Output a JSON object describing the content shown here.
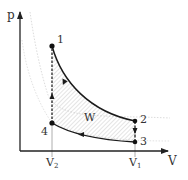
{
  "diagram": {
    "axes": {
      "y_label": "p",
      "x_label": "V"
    },
    "points": [
      {
        "id": "1",
        "label": "1",
        "x": 52,
        "y": 46
      },
      {
        "id": "2",
        "label": "2",
        "x": 135,
        "y": 121
      },
      {
        "id": "3",
        "label": "3",
        "x": 135,
        "y": 142
      },
      {
        "id": "4",
        "label": "4",
        "x": 52,
        "y": 123
      }
    ],
    "volume_ticks": [
      {
        "id": "V2",
        "base": "V",
        "sub": "2",
        "x": 52
      },
      {
        "id": "V1",
        "base": "V",
        "sub": "1",
        "x": 135
      }
    ],
    "work_label": "W",
    "processes": [
      {
        "from": "1",
        "to": "2",
        "type": "adiabatic expansion",
        "style": "solid"
      },
      {
        "from": "2",
        "to": "3",
        "type": "isochoric",
        "style": "solid-arrow-down"
      },
      {
        "from": "3",
        "to": "4",
        "type": "adiabatic compression",
        "style": "solid"
      },
      {
        "from": "4",
        "to": "1",
        "type": "isochoric",
        "style": "dashed"
      }
    ],
    "colors": {
      "line": "#1a1a1a",
      "axis": "#222222",
      "guide": "#9a9a9a",
      "hatch": "#b8b8b8",
      "faint_curve": "#d8d8d8"
    }
  }
}
